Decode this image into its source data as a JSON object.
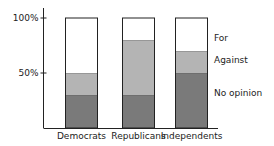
{
  "chart_data": {
    "type": "bar",
    "stacked": true,
    "title": "",
    "xlabel": "",
    "ylabel": "",
    "ylim": [
      0,
      100
    ],
    "yticks": [
      {
        "value": 50,
        "label": "50%"
      },
      {
        "value": 100,
        "label": "100%"
      }
    ],
    "categories": [
      "Democrats",
      "Republicans",
      "Independents"
    ],
    "series": [
      {
        "name": "No opinion",
        "values": [
          30,
          30,
          50
        ],
        "color": "#7a7a7a"
      },
      {
        "name": "Against",
        "values": [
          20,
          50,
          20
        ],
        "color": "#b4b4b4"
      },
      {
        "name": "For",
        "values": [
          50,
          20,
          30
        ],
        "color": "#ffffff"
      }
    ],
    "legend_placement": "right",
    "grid": false
  }
}
